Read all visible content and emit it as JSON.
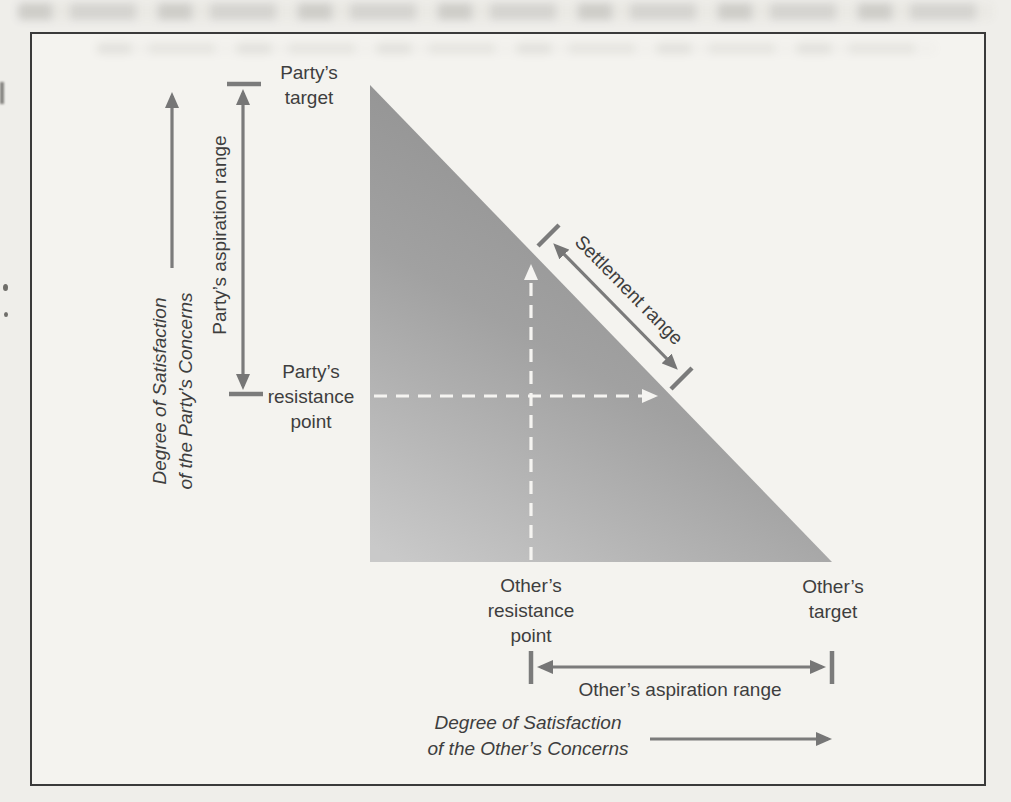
{
  "figure_labels": {
    "y_axis": "Degree of Satisfaction\nof the Party’s Concerns",
    "x_axis": "Degree of Satisfaction\nof the Other’s Concerns",
    "party_target": "Party’s\ntarget",
    "party_aspiration": "Party’s aspiration range",
    "party_resistance": "Party’s\nresistance\npoint",
    "settlement_range": "Settlement range",
    "others_resistance": "Other’s\nresistance\npoint",
    "others_target": "Other’s\ntarget",
    "others_aspiration": "Other’s aspiration range"
  },
  "colors": {
    "page_background": "#efeeea",
    "frame_background": "#f4f3ef",
    "frame_border": "#3a3a3a",
    "arrow_gray": "#7b7b7b",
    "text": "#3e3e3e",
    "triangle_gradient_dark": "#8c8c8c",
    "triangle_gradient_light": "#c9c9c9",
    "dashed_line_white": "#f5f4f1"
  }
}
